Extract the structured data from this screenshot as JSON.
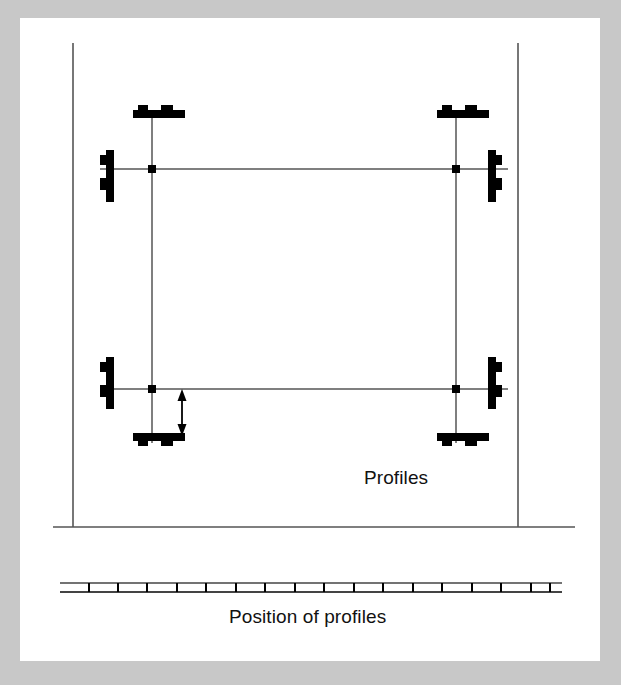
{
  "figure": {
    "title_label": "Profiles",
    "caption_label": "Position of profiles",
    "colors": {
      "page_background": "#ffffff",
      "outer_frame": "#c8c8c8",
      "line": "#555555",
      "profile_fill": "#000000",
      "text": "#111111"
    },
    "boundary": {
      "left_line_x": 73,
      "right_line_x": 518,
      "top_y": 43,
      "ground_y": 527,
      "ground_x_start": 53,
      "ground_x_end": 575
    },
    "grid": {
      "left_x": 152,
      "right_x": 456,
      "top_y": 169,
      "bottom_y": 389,
      "node_size": 8
    },
    "profiles": [
      {
        "name": "profile-top-left",
        "orientation": "horizontal",
        "facing": "up",
        "x": 152,
        "y": 114
      },
      {
        "name": "profile-top-right",
        "orientation": "horizontal",
        "facing": "up",
        "x": 456,
        "y": 114
      },
      {
        "name": "profile-bottom-left",
        "orientation": "horizontal",
        "facing": "down",
        "x": 152,
        "y": 437
      },
      {
        "name": "profile-bottom-right",
        "orientation": "horizontal",
        "facing": "down",
        "x": 456,
        "y": 437
      },
      {
        "name": "profile-left-top",
        "orientation": "vertical",
        "facing": "left",
        "x": 110,
        "y": 175
      },
      {
        "name": "profile-left-bottom",
        "orientation": "vertical",
        "facing": "left",
        "x": 110,
        "y": 383
      },
      {
        "name": "profile-right-top",
        "orientation": "vertical",
        "facing": "right",
        "x": 492,
        "y": 175
      },
      {
        "name": "profile-right-bottom",
        "orientation": "vertical",
        "facing": "right",
        "x": 492,
        "y": 383
      }
    ],
    "dimension_arrow": {
      "name": "spacing-dimension-arrow",
      "x": 182,
      "y_top": 392,
      "y_bottom": 432
    },
    "ruler": {
      "x_start": 60,
      "x_end": 562,
      "y_top": 583,
      "y_bottom": 592,
      "tick_count": 17,
      "tick_positions": [
        89,
        118,
        147,
        177,
        206,
        236,
        265,
        295,
        324,
        354,
        383,
        413,
        442,
        472,
        501,
        531,
        550
      ]
    }
  }
}
